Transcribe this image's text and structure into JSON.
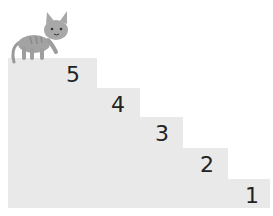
{
  "diagram": {
    "type": "staircase",
    "step_color": "#e9e9e9",
    "steps": [
      {
        "label": "5",
        "top": 58
      },
      {
        "label": "4",
        "top": 88
      },
      {
        "label": "3",
        "top": 117
      },
      {
        "label": "2",
        "top": 148
      },
      {
        "label": "1",
        "top": 179
      }
    ],
    "character": "cat-icon"
  }
}
